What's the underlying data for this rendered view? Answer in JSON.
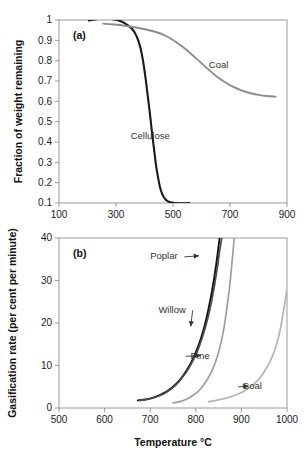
{
  "figure": {
    "title": "",
    "panel_a_tag": "(a)",
    "panel_b_tag": "(b)"
  },
  "chart_data": [
    {
      "type": "line",
      "panel": "(a)",
      "title": "",
      "xlabel": "",
      "ylabel": "Fraction of weight remaining",
      "xlim": [
        100,
        900
      ],
      "ylim": [
        0.1,
        1
      ],
      "xticks": [
        100,
        300,
        500,
        700,
        900
      ],
      "xtick_labels": [
        "100",
        "300",
        "500",
        "700",
        "900"
      ],
      "yticks": [
        0.1,
        0.2,
        0.3,
        0.4,
        0.5,
        0.6,
        0.7,
        0.8,
        0.9,
        1
      ],
      "ytick_labels": [
        "0.1",
        "0.2",
        "0.3",
        "0.4",
        "0.5",
        "0.6",
        "0.7",
        "0.8",
        "0.9",
        "1"
      ],
      "grid": false,
      "legend": "inline-annotations",
      "series": [
        {
          "name": "Cellulose",
          "color": "#1a1a1a",
          "width": 2.1,
          "label_x": 420,
          "label_y": 0.43,
          "points": [
            [
              205,
              0.998
            ],
            [
              225,
              1.003
            ],
            [
              250,
              1.007
            ],
            [
              270,
              1.007
            ],
            [
              290,
              1.004
            ],
            [
              310,
              0.997
            ],
            [
              330,
              0.985
            ],
            [
              350,
              0.965
            ],
            [
              365,
              0.94
            ],
            [
              378,
              0.9
            ],
            [
              388,
              0.85
            ],
            [
              397,
              0.78
            ],
            [
              405,
              0.7
            ],
            [
              412,
              0.62
            ],
            [
              419,
              0.54
            ],
            [
              426,
              0.45
            ],
            [
              433,
              0.37
            ],
            [
              440,
              0.29
            ],
            [
              447,
              0.23
            ],
            [
              454,
              0.18
            ],
            [
              462,
              0.145
            ],
            [
              472,
              0.12
            ],
            [
              484,
              0.107
            ],
            [
              500,
              0.101
            ],
            [
              520,
              0.099
            ],
            [
              545,
              0.099
            ],
            [
              557,
              0.1
            ]
          ]
        },
        {
          "name": "Coal",
          "color": "#8c8c8c",
          "width": 1.9,
          "label_x": 660,
          "label_y": 0.78,
          "points": [
            [
              255,
              0.982
            ],
            [
              290,
              0.978
            ],
            [
              330,
              0.972
            ],
            [
              370,
              0.963
            ],
            [
              410,
              0.952
            ],
            [
              440,
              0.941
            ],
            [
              470,
              0.925
            ],
            [
              500,
              0.902
            ],
            [
              530,
              0.872
            ],
            [
              560,
              0.838
            ],
            [
              590,
              0.8
            ],
            [
              620,
              0.762
            ],
            [
              650,
              0.726
            ],
            [
              680,
              0.696
            ],
            [
              710,
              0.672
            ],
            [
              740,
              0.654
            ],
            [
              770,
              0.641
            ],
            [
              800,
              0.632
            ],
            [
              830,
              0.626
            ],
            [
              860,
              0.623
            ]
          ]
        }
      ]
    },
    {
      "type": "line",
      "panel": "(b)",
      "title": "",
      "xlabel": "Temperature °C",
      "ylabel": "Gasification rate (per cent per minute)",
      "xlim": [
        500,
        1000
      ],
      "ylim": [
        0,
        40
      ],
      "xticks": [
        500,
        600,
        700,
        800,
        900,
        1000
      ],
      "xtick_labels": [
        "500",
        "600",
        "700",
        "800",
        "900",
        "1000"
      ],
      "yticks": [
        0,
        10,
        20,
        30,
        40
      ],
      "ytick_labels": [
        "0",
        "10",
        "20",
        "30",
        "40"
      ],
      "grid": false,
      "legend": "inline-annotations",
      "series": [
        {
          "name": "Poplar",
          "color": "#111111",
          "width": 1.9,
          "label_x": 700,
          "label_y": 35.8,
          "arrow_to_x": 818,
          "arrow_to_y": 35.8,
          "points": [
            [
              673,
              1.8
            ],
            [
              690,
              2.0
            ],
            [
              705,
              2.4
            ],
            [
              720,
              3.0
            ],
            [
              735,
              3.8
            ],
            [
              748,
              4.8
            ],
            [
              760,
              6.0
            ],
            [
              772,
              7.6
            ],
            [
              783,
              9.4
            ],
            [
              793,
              11.4
            ],
            [
              802,
              13.6
            ],
            [
              810,
              16.0
            ],
            [
              818,
              18.8
            ],
            [
              824,
              21.4
            ],
            [
              830,
              24.4
            ],
            [
              835,
              27.2
            ],
            [
              840,
              30.4
            ],
            [
              844,
              33.2
            ],
            [
              848,
              36.4
            ],
            [
              851,
              39.0
            ],
            [
              853,
              40.6
            ]
          ]
        },
        {
          "name": "Willow",
          "color": "#4d4d4d",
          "width": 1.7,
          "label_x": 718,
          "label_y": 23.2,
          "arrow_to_x": 800,
          "arrow_to_y": 19.2,
          "points": [
            [
              676,
              1.8
            ],
            [
              692,
              2.0
            ],
            [
              708,
              2.4
            ],
            [
              723,
              3.0
            ],
            [
              738,
              3.9
            ],
            [
              751,
              4.9
            ],
            [
              763,
              6.2
            ],
            [
              775,
              7.8
            ],
            [
              786,
              9.6
            ],
            [
              796,
              11.6
            ],
            [
              805,
              13.8
            ],
            [
              813,
              16.2
            ],
            [
              821,
              19.0
            ],
            [
              828,
              21.8
            ],
            [
              834,
              24.8
            ],
            [
              839,
              27.6
            ],
            [
              844,
              30.8
            ],
            [
              848,
              33.6
            ],
            [
              852,
              36.8
            ],
            [
              856,
              39.4
            ],
            [
              858,
              40.6
            ]
          ]
        },
        {
          "name": "Pine",
          "color": "#9e9e9e",
          "width": 1.7,
          "label_x": 830,
          "label_y": 12.4,
          "arrow_to_x": 800,
          "arrow_to_y": 12.4,
          "points": [
            [
              750,
              1.2
            ],
            [
              765,
              1.5
            ],
            [
              778,
              2.0
            ],
            [
              790,
              2.7
            ],
            [
              802,
              3.6
            ],
            [
              812,
              4.7
            ],
            [
              821,
              6.0
            ],
            [
              830,
              7.6
            ],
            [
              838,
              9.4
            ],
            [
              845,
              11.4
            ],
            [
              851,
              13.6
            ],
            [
              857,
              16.2
            ],
            [
              862,
              19.0
            ],
            [
              866,
              21.8
            ],
            [
              870,
              25.0
            ],
            [
              874,
              28.4
            ],
            [
              877,
              31.6
            ],
            [
              880,
              35.0
            ],
            [
              883,
              38.4
            ],
            [
              885,
              40.6
            ]
          ]
        },
        {
          "name": "Coal",
          "color": "#b3b3b3",
          "width": 1.7,
          "label_x": 945,
          "label_y": 5.2,
          "arrow_to_x": 905,
          "arrow_to_y": 5.2,
          "points": [
            [
              828,
              1.5
            ],
            [
              845,
              1.8
            ],
            [
              862,
              2.2
            ],
            [
              878,
              2.7
            ],
            [
              893,
              3.3
            ],
            [
              906,
              4.0
            ],
            [
              918,
              4.8
            ],
            [
              929,
              5.8
            ],
            [
              939,
              6.9
            ],
            [
              948,
              8.2
            ],
            [
              956,
              9.6
            ],
            [
              964,
              11.2
            ],
            [
              971,
              13.0
            ],
            [
              977,
              15.0
            ],
            [
              983,
              17.4
            ],
            [
              988,
              20.0
            ],
            [
              992,
              22.6
            ],
            [
              996,
              25.2
            ],
            [
              999,
              27.4
            ]
          ]
        }
      ]
    }
  ]
}
